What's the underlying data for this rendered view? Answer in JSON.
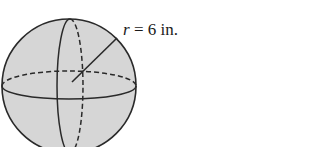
{
  "figure": {
    "shape": "sphere",
    "label": {
      "variable": "r",
      "equals": " = ",
      "value": "6",
      "unit": " in."
    },
    "colors": {
      "fill": "#d4d4d4",
      "stroke": "#2a2a2a",
      "text": "#1a1a1a"
    }
  }
}
